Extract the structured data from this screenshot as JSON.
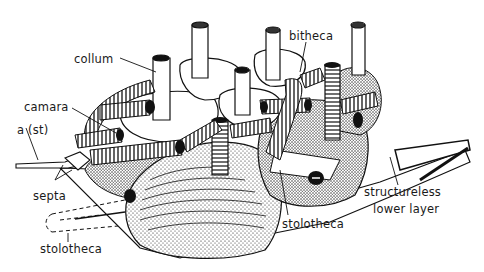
{
  "figure": {
    "labels": {
      "collum": "collum",
      "camara": "camara",
      "a_st": "a (st)",
      "septa": "septa",
      "stolotheca_left": "stolotheca",
      "bitheca": "bitheca",
      "stolotheca_right": "stolotheca",
      "structureless_line1": "structureless",
      "structureless_line2": "lower layer"
    },
    "colors": {
      "ink": "#111111",
      "paper": "#ffffff"
    }
  }
}
